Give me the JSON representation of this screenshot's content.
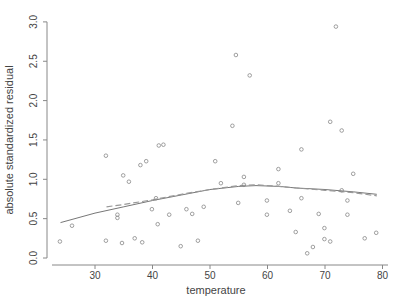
{
  "chart_data": {
    "type": "scatter",
    "title": "",
    "xlabel": "temperature",
    "ylabel": "absolute standardized residual",
    "xlim": [
      22,
      80
    ],
    "ylim": [
      0,
      3.0
    ],
    "x_ticks": [
      30,
      40,
      50,
      60,
      70,
      80
    ],
    "x_tick_labels": [
      "30",
      "40",
      "50",
      "60",
      "70",
      "80"
    ],
    "y_ticks": [
      0.0,
      0.5,
      1.0,
      1.5,
      2.0,
      2.5,
      3.0
    ],
    "y_tick_labels": [
      "0.0",
      "0.5",
      "1.0",
      "1.5",
      "2.0",
      "2.5",
      "3.0"
    ],
    "grid": false,
    "legend": null,
    "series": [
      {
        "name": "residuals",
        "kind": "points",
        "marker": "open-circle",
        "points": [
          [
            23.9,
            0.21
          ],
          [
            26.0,
            0.41
          ],
          [
            31.9,
            1.3
          ],
          [
            31.9,
            0.22
          ],
          [
            33.9,
            0.55
          ],
          [
            33.9,
            0.51
          ],
          [
            34.7,
            0.19
          ],
          [
            34.9,
            1.05
          ],
          [
            35.9,
            0.97
          ],
          [
            36.9,
            0.25
          ],
          [
            37.9,
            1.18
          ],
          [
            38.2,
            0.2
          ],
          [
            38.9,
            1.23
          ],
          [
            39.9,
            0.62
          ],
          [
            40.6,
            0.76
          ],
          [
            40.9,
            0.43
          ],
          [
            41.1,
            1.43
          ],
          [
            41.9,
            1.44
          ],
          [
            42.9,
            0.55
          ],
          [
            44.9,
            0.15
          ],
          [
            45.9,
            0.62
          ],
          [
            46.9,
            0.56
          ],
          [
            47.9,
            0.22
          ],
          [
            48.9,
            0.65
          ],
          [
            50.9,
            1.23
          ],
          [
            51.9,
            0.95
          ],
          [
            53.9,
            1.68
          ],
          [
            54.5,
            2.58
          ],
          [
            54.9,
            0.7
          ],
          [
            55.9,
            0.93
          ],
          [
            55.9,
            1.03
          ],
          [
            56.9,
            2.32
          ],
          [
            59.9,
            0.73
          ],
          [
            59.9,
            0.55
          ],
          [
            61.9,
            1.13
          ],
          [
            61.9,
            0.95
          ],
          [
            63.9,
            0.6
          ],
          [
            64.9,
            0.33
          ],
          [
            65.9,
            1.38
          ],
          [
            65.9,
            0.76
          ],
          [
            66.9,
            0.06
          ],
          [
            67.9,
            0.14
          ],
          [
            68.9,
            0.56
          ],
          [
            69.9,
            0.38
          ],
          [
            70.9,
            1.73
          ],
          [
            71.9,
            2.94
          ],
          [
            72.9,
            0.86
          ],
          [
            72.9,
            1.62
          ],
          [
            73.9,
            0.73
          ],
          [
            73.9,
            0.55
          ],
          [
            74.9,
            1.07
          ],
          [
            76.9,
            0.25
          ],
          [
            78.9,
            0.32
          ],
          [
            69.9,
            0.24
          ],
          [
            70.9,
            0.21
          ]
        ]
      },
      {
        "name": "smooth fit (solid)",
        "kind": "line",
        "style": "solid",
        "points": [
          [
            24,
            0.45
          ],
          [
            30,
            0.57
          ],
          [
            35,
            0.65
          ],
          [
            40,
            0.73
          ],
          [
            45,
            0.8
          ],
          [
            50,
            0.87
          ],
          [
            55,
            0.91
          ],
          [
            58,
            0.92
          ],
          [
            62,
            0.91
          ],
          [
            65,
            0.89
          ],
          [
            70,
            0.87
          ],
          [
            75,
            0.84
          ],
          [
            79,
            0.81
          ]
        ]
      },
      {
        "name": "smooth fit (dashed)",
        "kind": "line",
        "style": "dashed",
        "points": [
          [
            32,
            0.65
          ],
          [
            35,
            0.68
          ],
          [
            40,
            0.74
          ],
          [
            45,
            0.81
          ],
          [
            50,
            0.87
          ],
          [
            55,
            0.92
          ],
          [
            58,
            0.93
          ],
          [
            62,
            0.91
          ],
          [
            65,
            0.89
          ],
          [
            70,
            0.86
          ],
          [
            75,
            0.83
          ],
          [
            79,
            0.79
          ]
        ]
      }
    ]
  }
}
